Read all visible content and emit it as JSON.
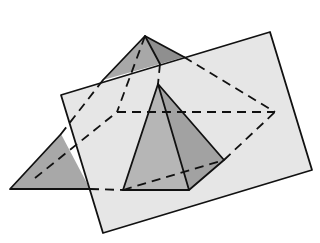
{
  "figure": {
    "colors": {
      "background": "#ffffff",
      "plane_fill": "#e6e6e6",
      "pyramid_face_dark": "#9a9a9a",
      "pyramid_face_mid": "#b0b0b0",
      "small_face_left": "#b8b8b8",
      "small_face_right": "#a4a4a4",
      "line": "#111111"
    },
    "large_pyramid": {
      "apex": [
        145,
        36
      ],
      "base": [
        [
          10,
          189
        ],
        [
          123,
          190
        ],
        [
          275,
          112
        ],
        [
          117,
          112
        ]
      ]
    },
    "plane": {
      "corners": [
        [
          61,
          95
        ],
        [
          270,
          32
        ],
        [
          312,
          170
        ],
        [
          103,
          233
        ]
      ]
    },
    "small_pyramid": {
      "apex": [
        158,
        84
      ],
      "base_visible": [
        [
          123,
          190
        ],
        [
          189,
          190
        ],
        [
          224,
          160
        ]
      ]
    }
  }
}
